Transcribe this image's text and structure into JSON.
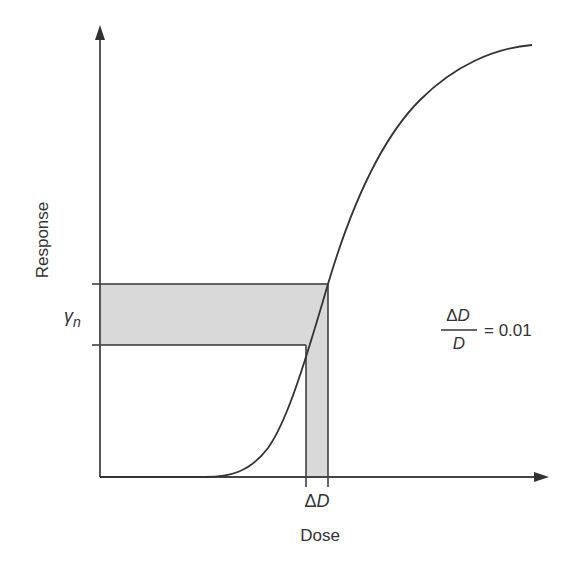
{
  "diagram": {
    "type": "dose-response curve",
    "axes": {
      "x_label": "Dose",
      "y_label": "Response"
    },
    "labels": {
      "gamma": "γ",
      "gamma_sub": "n",
      "delta_d_delta": "Δ",
      "delta_d_var": "D",
      "equation_num_delta": "Δ",
      "equation_num_var": "D",
      "equation_den": "D",
      "equation_rhs": "= 0.01"
    },
    "colors": {
      "line": "#333333",
      "shade": "#d9d9d9",
      "background": "#ffffff"
    },
    "geometry": {
      "origin": [
        100,
        477
      ],
      "y_axis_top": 25,
      "x_axis_right": 549,
      "response_band": {
        "y_top": 284,
        "y_bottom": 345
      },
      "dose_band": {
        "x_left": 306,
        "x_right": 328
      }
    }
  }
}
